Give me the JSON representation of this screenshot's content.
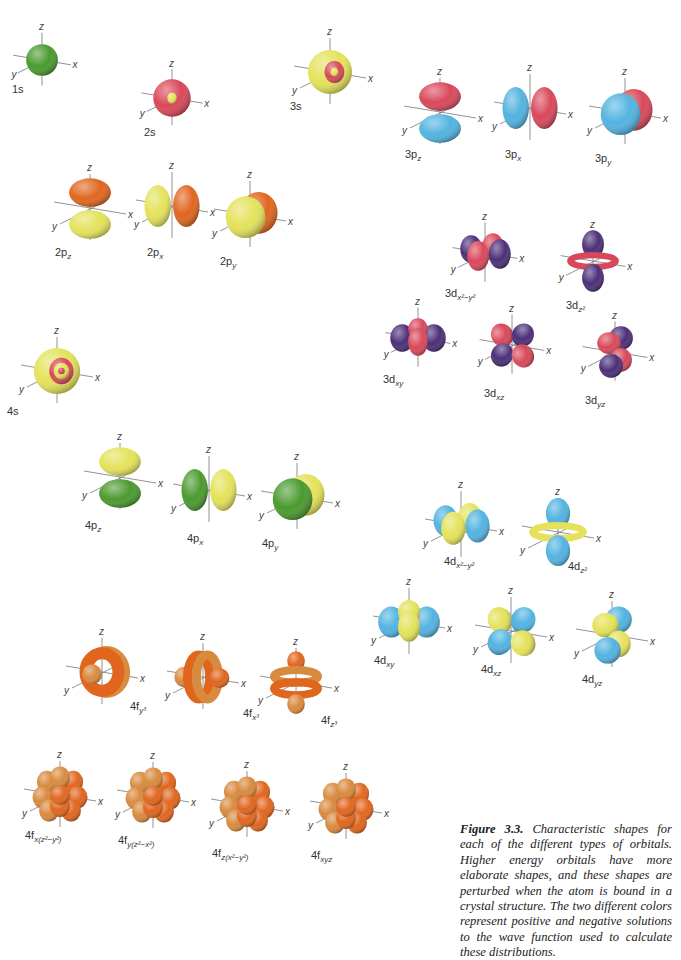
{
  "figure": {
    "caption_title": "Figure 3.3.",
    "caption_text": "Characteristic shapes for each of the different types of orbitals. Higher energy orbitals have more elaborate shapes, and these shapes are perturbed when the atom is bound in a crystal structure. The two different colors represent positive and negative solutions to the wave function used to calculate these distributions."
  },
  "axis_labels": {
    "x": "x",
    "y": "y",
    "z": "z"
  },
  "colors": {
    "green": "#4a9a2e",
    "red": "#d9485a",
    "yellow": "#e4e25a",
    "blue": "#52b3e0",
    "orange": "#e0661e",
    "purple": "#4b2f78",
    "orange_light": "#d88a3e"
  },
  "orbitals": [
    {
      "id": "1s",
      "label": "1s",
      "shape": "s1",
      "colors": [
        "green"
      ]
    },
    {
      "id": "2s",
      "label": "2s",
      "shape": "s2",
      "colors": [
        "red",
        "yellow"
      ]
    },
    {
      "id": "3s",
      "label": "3s",
      "shape": "s3",
      "colors": [
        "yellow",
        "red"
      ]
    },
    {
      "id": "3pz",
      "label": "3p",
      "sub": "z",
      "shape": "pz",
      "colors": [
        "red",
        "blue"
      ]
    },
    {
      "id": "3px",
      "label": "3p",
      "sub": "x",
      "shape": "px",
      "colors": [
        "red",
        "blue"
      ]
    },
    {
      "id": "3py",
      "label": "3p",
      "sub": "y",
      "shape": "py",
      "colors": [
        "red",
        "blue"
      ]
    },
    {
      "id": "2pz",
      "label": "2p",
      "sub": "z",
      "shape": "pz",
      "colors": [
        "orange",
        "yellow"
      ]
    },
    {
      "id": "2px",
      "label": "2p",
      "sub": "x",
      "shape": "px",
      "colors": [
        "orange",
        "yellow"
      ]
    },
    {
      "id": "2py",
      "label": "2p",
      "sub": "y",
      "shape": "py",
      "colors": [
        "orange",
        "yellow"
      ]
    },
    {
      "id": "3dx2y2",
      "label": "3d",
      "sub": "x²−y²",
      "shape": "dx2y2",
      "colors": [
        "red",
        "purple"
      ]
    },
    {
      "id": "3dz2",
      "label": "3d",
      "sub": "z²",
      "shape": "dz2",
      "colors": [
        "red",
        "purple"
      ]
    },
    {
      "id": "3dxy",
      "label": "3d",
      "sub": "xy",
      "shape": "dxy",
      "colors": [
        "red",
        "purple"
      ]
    },
    {
      "id": "3dxz",
      "label": "3d",
      "sub": "xz",
      "shape": "dxz",
      "colors": [
        "red",
        "purple"
      ]
    },
    {
      "id": "3dyz",
      "label": "3d",
      "sub": "yz",
      "shape": "dyz",
      "colors": [
        "red",
        "purple"
      ]
    },
    {
      "id": "4s",
      "label": "4s",
      "shape": "s4",
      "colors": [
        "yellow",
        "red"
      ]
    },
    {
      "id": "4pz",
      "label": "4p",
      "sub": "z",
      "shape": "pz",
      "colors": [
        "yellow",
        "green"
      ]
    },
    {
      "id": "4px",
      "label": "4p",
      "sub": "x",
      "shape": "px",
      "colors": [
        "yellow",
        "green"
      ]
    },
    {
      "id": "4py",
      "label": "4p",
      "sub": "y",
      "shape": "py",
      "colors": [
        "yellow",
        "green"
      ]
    },
    {
      "id": "4dx2y2",
      "label": "4d",
      "sub": "x²−y²",
      "shape": "dx2y2",
      "colors": [
        "yellow",
        "blue"
      ]
    },
    {
      "id": "4dz2",
      "label": "4d",
      "sub": "z²",
      "shape": "dz2",
      "colors": [
        "yellow",
        "blue"
      ]
    },
    {
      "id": "4dxy",
      "label": "4d",
      "sub": "xy",
      "shape": "dxy",
      "colors": [
        "yellow",
        "blue"
      ]
    },
    {
      "id": "4dxz",
      "label": "4d",
      "sub": "xz",
      "shape": "dxz",
      "colors": [
        "yellow",
        "blue"
      ]
    },
    {
      "id": "4dyz",
      "label": "4d",
      "sub": "yz",
      "shape": "dyz",
      "colors": [
        "yellow",
        "blue"
      ]
    },
    {
      "id": "4fy3",
      "label": "4f",
      "sub": "y³",
      "shape": "fy3",
      "colors": [
        "orange",
        "orange_light"
      ]
    },
    {
      "id": "4fx3",
      "label": "4f",
      "sub": "x³",
      "shape": "fx3",
      "colors": [
        "orange",
        "orange_light"
      ]
    },
    {
      "id": "4fz3",
      "label": "4f",
      "sub": "z³",
      "shape": "fz3",
      "colors": [
        "orange",
        "orange_light"
      ]
    },
    {
      "id": "4fxz2y2",
      "label": "4f",
      "sub": "x(z²−y²)",
      "shape": "fcube",
      "colors": [
        "orange",
        "orange_light"
      ]
    },
    {
      "id": "4fyz2x2",
      "label": "4f",
      "sub": "y(z²−x²)",
      "shape": "fcube",
      "colors": [
        "orange",
        "orange_light"
      ]
    },
    {
      "id": "4fzx2y2",
      "label": "4f",
      "sub": "z(x²−y²)",
      "shape": "fcube",
      "colors": [
        "orange",
        "orange_light"
      ]
    },
    {
      "id": "4fxyz",
      "label": "4f",
      "sub": "xyz",
      "shape": "fcube",
      "colors": [
        "orange",
        "orange_light"
      ]
    }
  ]
}
